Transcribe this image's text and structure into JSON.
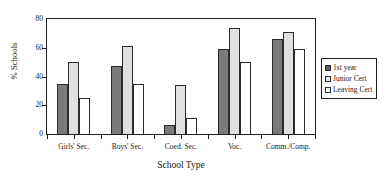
{
  "chart_data": {
    "type": "bar",
    "title": "",
    "subtitle": "",
    "xlabel": "School Type",
    "ylabel": "% Schools",
    "categories": [
      "Girls' Sec.",
      "Boys' Sec.",
      "Coed. Sec.",
      "Voc.",
      "Comm./Comp."
    ],
    "series": [
      {
        "name": "1st year",
        "values": [
          35,
          47,
          6,
          59,
          66
        ],
        "color": "#7a7a7a"
      },
      {
        "name": "Junior Cert",
        "values": [
          50,
          61,
          34,
          74,
          71
        ],
        "color": "#e0e0e0"
      },
      {
        "name": "Leaving Cert",
        "values": [
          25,
          35,
          11,
          50,
          59
        ],
        "color": "#ffffff"
      }
    ],
    "ylim": [
      0,
      80
    ],
    "yticks": [
      0,
      20,
      40,
      60,
      80
    ],
    "ytick_labels": [
      "0",
      "20",
      "40",
      "60",
      "80"
    ],
    "grid": false,
    "legend_position": "right"
  },
  "legend": {
    "items": [
      {
        "label": "1st year"
      },
      {
        "label": "Junior Cert"
      },
      {
        "label": "Leaving Cert"
      }
    ]
  }
}
